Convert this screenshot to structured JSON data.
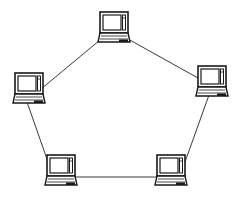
{
  "diagram": {
    "type": "ring-network-topology",
    "colors": {
      "line": "#3a3a3a",
      "device": "#1a1a1a",
      "background": "#ffffff"
    },
    "nodes": [
      {
        "id": "top",
        "icon": "laptop-icon",
        "x": 100,
        "y": 12
      },
      {
        "id": "left",
        "icon": "laptop-icon",
        "x": 15,
        "y": 73
      },
      {
        "id": "right",
        "icon": "laptop-icon",
        "x": 198,
        "y": 66
      },
      {
        "id": "bottom-left",
        "icon": "laptop-icon",
        "x": 47,
        "y": 155
      },
      {
        "id": "bottom-right",
        "icon": "laptop-icon",
        "x": 157,
        "y": 155
      }
    ],
    "links": [
      {
        "from": "top",
        "to": "right"
      },
      {
        "from": "top",
        "to": "left"
      },
      {
        "from": "left",
        "to": "bottom-left"
      },
      {
        "from": "right",
        "to": "bottom-right"
      },
      {
        "from": "bottom-left",
        "to": "bottom-right"
      }
    ]
  }
}
